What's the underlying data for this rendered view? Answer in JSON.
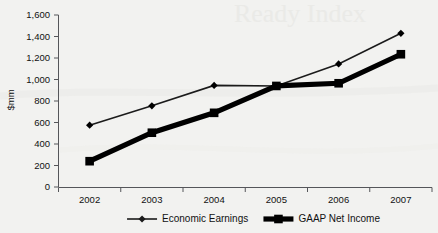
{
  "chart_data": {
    "type": "line",
    "title": "",
    "subtitle": "",
    "xlabel": "",
    "ylabel": "$mm",
    "categories": [
      "2002",
      "2003",
      "2004",
      "2005",
      "2006",
      "2007"
    ],
    "ylim": [
      0,
      1600
    ],
    "ytick_values": [
      0,
      200,
      400,
      600,
      800,
      1000,
      1200,
      1400,
      1600
    ],
    "ytick_labels": [
      "0",
      "200",
      "400",
      "600",
      "800",
      "1,000",
      "1,200",
      "1,400",
      "1,600"
    ],
    "grid": false,
    "legend_position": "bottom",
    "series": [
      {
        "name": "Economic Earnings",
        "marker": "diamond",
        "line_style": "thin",
        "color": "#1b1b1b",
        "values": [
          575,
          755,
          945,
          940,
          1145,
          1430
        ]
      },
      {
        "name": "GAAP Net Income",
        "marker": "square",
        "line_style": "thick",
        "color": "#000000",
        "values": [
          240,
          505,
          690,
          940,
          965,
          1235
        ]
      }
    ]
  },
  "background": {
    "color": "#f2f2f0",
    "watermark_text": ""
  },
  "colors": {
    "axis": "#55565a",
    "text": "#111111",
    "series_economic_earnings": "#1b1b1b",
    "series_gaap_net_income": "#000000"
  }
}
